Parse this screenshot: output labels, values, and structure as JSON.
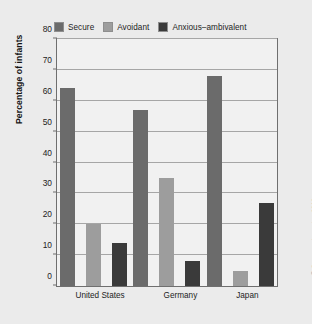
{
  "chart_data": {
    "type": "bar",
    "title": "",
    "subtitle": "",
    "xlabel": "",
    "ylabel": "Percentage of infants",
    "categories": [
      "United States",
      "Germany",
      "Japan"
    ],
    "series": [
      {
        "name": "Secure",
        "color": "#6b6b6b",
        "values": [
          64,
          57,
          68
        ]
      },
      {
        "name": "Avoidant",
        "color": "#9d9d9d",
        "values": [
          20,
          35,
          5
        ]
      },
      {
        "name": "Anxious–ambivalent",
        "color": "#3a3a3a",
        "values": [
          14,
          8,
          27
        ]
      }
    ],
    "ylim": [
      0,
      80
    ],
    "yticks": [
      0,
      10,
      20,
      30,
      40,
      50,
      60,
      70,
      80
    ],
    "ytick_labels": [
      "0",
      "10",
      "20",
      "30",
      "40",
      "50",
      "60",
      "70",
      "80"
    ],
    "grid": true,
    "legend_position": "top"
  },
  "credit": "© Cengage Learning 2013",
  "colors": {
    "background": "#ebebeb",
    "plot_background": "#f1f1f1",
    "axis": "#6f6f6f",
    "gridline": "#a6a6a6",
    "text": "#1d1d1d"
  }
}
